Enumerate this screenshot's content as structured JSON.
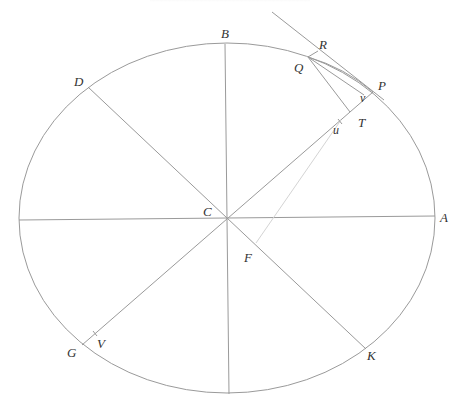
{
  "figure": {
    "colors": {
      "line": "#9a9a9a",
      "faint_line": "#d4d4d4",
      "label": "#333333",
      "background": "#ffffff"
    },
    "labels": {
      "A": "A",
      "B": "B",
      "C": "C",
      "D": "D",
      "F": "F",
      "G": "G",
      "K": "K",
      "P": "P",
      "Q": "Q",
      "R": "R",
      "T": "T",
      "V": "V",
      "u": "u",
      "v": "v"
    }
  }
}
